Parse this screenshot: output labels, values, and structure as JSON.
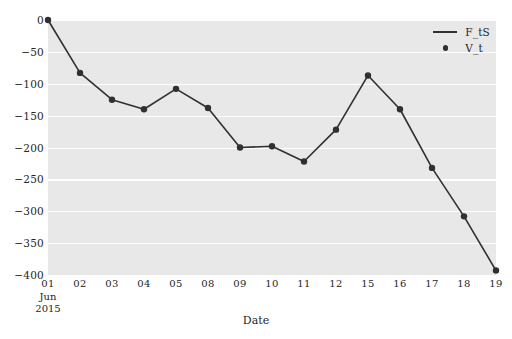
{
  "chart_data": {
    "type": "line",
    "title": "",
    "xlabel": "Date",
    "ylabel": "",
    "xlim": [
      0,
      14
    ],
    "ylim": [
      -400,
      0
    ],
    "grid": true,
    "grid_color": "#ffffff",
    "plot_bg": "#e8e8e8",
    "figure_bg": "#ffffff",
    "line_color": "#303030",
    "marker_color": "#303030",
    "marker": "circle",
    "legend_position": "upper right",
    "x_tick_labels": [
      "01",
      "02",
      "03",
      "04",
      "05",
      "08",
      "09",
      "10",
      "11",
      "12",
      "15",
      "16",
      "17",
      "18",
      "19"
    ],
    "x_axis_sub_labels": [
      "Jun",
      "2015"
    ],
    "x_axis_sub_index": 0,
    "y_ticks": [
      0,
      -50,
      -100,
      -150,
      -200,
      -250,
      -300,
      -350,
      -400
    ],
    "y_tick_labels": [
      "0",
      "−50",
      "−100",
      "−150",
      "−200",
      "−250",
      "−300",
      "−350",
      "−400"
    ],
    "categories": [
      "01",
      "02",
      "03",
      "04",
      "05",
      "08",
      "09",
      "10",
      "11",
      "12",
      "15",
      "16",
      "17",
      "18",
      "19"
    ],
    "series": [
      {
        "name": "V_t",
        "marker": "circle",
        "values": [
          0,
          -83,
          -125,
          -140,
          -108,
          -138,
          -200,
          -198,
          -222,
          -172,
          -87,
          -140,
          -232,
          -308,
          -393
        ]
      }
    ],
    "legend": [
      {
        "label": "F_tS",
        "key": "line"
      },
      {
        "label": "V_t",
        "key": "dot"
      }
    ]
  }
}
